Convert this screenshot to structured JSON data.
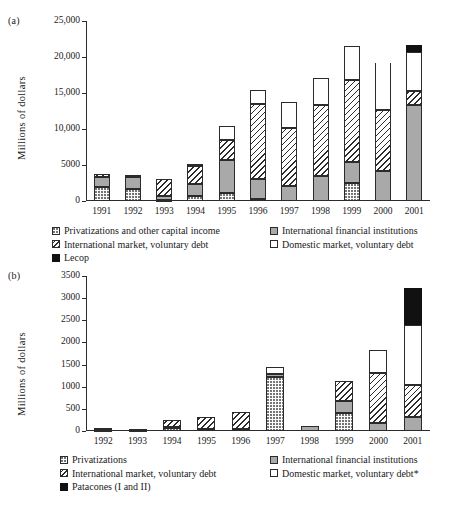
{
  "figure": {
    "panel_a_tag": "(a)",
    "panel_b_tag": "(b)"
  },
  "chart_data": [
    {
      "panel": "(a)",
      "type": "bar",
      "stacked": true,
      "title": "",
      "xlabel": "",
      "ylabel": "Millions of dollars",
      "ylim": [
        0,
        25000
      ],
      "yticks": [
        0,
        5000,
        10000,
        15000,
        20000,
        25000
      ],
      "ytick_labels": [
        "0",
        "5000",
        "10,000",
        "15,000",
        "20,000",
        "25,000"
      ],
      "grid": false,
      "legend_position": "below",
      "categories": [
        "1991",
        "1992",
        "1993",
        "1994",
        "1995",
        "1996",
        "1997",
        "1998",
        "1999",
        "2000",
        "2001"
      ],
      "series": [
        {
          "name": "Privatizations and other capital income",
          "pattern": "dotted",
          "values": [
            1950,
            1700,
            150,
            750,
            1050,
            250,
            0,
            0,
            2500,
            0,
            0
          ]
        },
        {
          "name": "International financial institutions",
          "pattern": "solid-grey",
          "values": [
            1450,
            1700,
            600,
            1550,
            4650,
            2750,
            2100,
            3500,
            2850,
            4100,
            13300
          ]
        },
        {
          "name": "International market, voluntary debt",
          "pattern": "diagonal-hatch",
          "values": [
            350,
            200,
            2250,
            2600,
            2750,
            10450,
            8100,
            9900,
            11500,
            8500,
            1950
          ]
        },
        {
          "name": "Domestic market, voluntary debt",
          "pattern": "open-white",
          "values": [
            0,
            0,
            0,
            250,
            2000,
            1950,
            3500,
            3650,
            4650,
            6550,
            5450
          ]
        },
        {
          "name": "Lecop",
          "pattern": "solid-black",
          "values": [
            0,
            0,
            0,
            0,
            0,
            0,
            0,
            0,
            0,
            0,
            900
          ]
        }
      ],
      "totals": [
        3750,
        3600,
        3000,
        5150,
        10450,
        15400,
        13700,
        17050,
        21500,
        19150,
        21600
      ],
      "notes": "The 2000 domestic-market segment is drawn open (no top cap line).",
      "legend": [
        {
          "label": "Privatizations and other capital income",
          "pattern": "dotted"
        },
        {
          "label": "International financial institutions",
          "pattern": "solid-grey"
        },
        {
          "label": "International market, voluntary debt",
          "pattern": "diagonal-hatch"
        },
        {
          "label": "Domestic market, voluntary debt",
          "pattern": "open-white"
        },
        {
          "label": "Lecop",
          "pattern": "solid-black"
        }
      ]
    },
    {
      "panel": "(b)",
      "type": "bar",
      "stacked": true,
      "title": "",
      "xlabel": "",
      "ylabel": "Millions of dollars",
      "ylim": [
        0,
        3500
      ],
      "yticks": [
        0,
        500,
        1000,
        1500,
        2000,
        2500,
        3000,
        3500
      ],
      "ytick_labels": [
        "0",
        "500",
        "1000",
        "1500",
        "2000",
        "2500",
        "3000",
        "3500"
      ],
      "grid": false,
      "legend_position": "below",
      "categories": [
        "1992",
        "1993",
        "1994",
        "1995",
        "1996",
        "1997",
        "1998",
        "1999",
        "2000",
        "2001"
      ],
      "series": [
        {
          "name": "Privatizations",
          "pattern": "dotted",
          "values": [
            20,
            20,
            70,
            0,
            0,
            1230,
            0,
            400,
            0,
            0
          ]
        },
        {
          "name": "International financial institutions",
          "pattern": "solid-grey",
          "values": [
            50,
            30,
            30,
            40,
            40,
            60,
            110,
            280,
            170,
            310
          ]
        },
        {
          "name": "International market, voluntary debt",
          "pattern": "diagonal-hatch",
          "values": [
            0,
            0,
            145,
            265,
            390,
            0,
            0,
            450,
            1150,
            730
          ]
        },
        {
          "name": "Domestic market, voluntary debt*",
          "pattern": "open-white",
          "values": [
            0,
            0,
            0,
            0,
            0,
            155,
            0,
            0,
            500,
            1360
          ]
        },
        {
          "name": "Patacones (I and II)",
          "pattern": "solid-black",
          "values": [
            0,
            0,
            0,
            0,
            0,
            0,
            0,
            0,
            0,
            830
          ]
        }
      ],
      "totals": [
        70,
        50,
        245,
        305,
        430,
        1445,
        110,
        1130,
        1820,
        3230
      ],
      "legend": [
        {
          "label": "Privatizations",
          "pattern": "dotted"
        },
        {
          "label": "International financial institutions",
          "pattern": "solid-grey"
        },
        {
          "label": "International market, voluntary debt",
          "pattern": "diagonal-hatch"
        },
        {
          "label": "Domestic market, voluntary debt*",
          "pattern": "open-white"
        },
        {
          "label": "Patacones (I and II)",
          "pattern": "solid-black"
        }
      ]
    }
  ]
}
